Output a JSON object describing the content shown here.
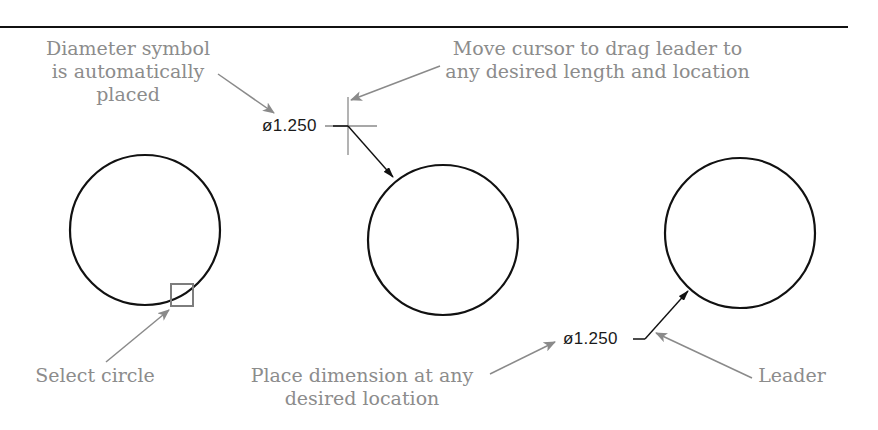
{
  "figure": {
    "type": "cad-dimensioning-illustration",
    "colors": {
      "geometry": "#111111",
      "callout_text": "#8c8c8c",
      "callout_arrow": "#8a8a8a",
      "crosshair": "#7a7a7a",
      "background": "#ffffff"
    }
  },
  "callouts": {
    "diameter_symbol": {
      "lines": [
        "Diameter symbol",
        "is automatically",
        "placed"
      ]
    },
    "move_cursor": {
      "lines": [
        "Move cursor to drag leader to",
        "any desired length and location"
      ]
    },
    "select_circle": {
      "lines": [
        "Select circle"
      ]
    },
    "place_dimension": {
      "lines": [
        "Place dimension at any",
        "desired location"
      ]
    },
    "leader": {
      "lines": [
        "Leader"
      ]
    }
  },
  "dimensions": [
    {
      "id": "dim-dragging",
      "text": "ø1.250",
      "value": 1.25,
      "symbol": "diameter"
    },
    {
      "id": "dim-placed",
      "text": "ø1.250",
      "value": 1.25,
      "symbol": "diameter"
    }
  ],
  "circles": [
    {
      "id": "circle-select",
      "cx": 145,
      "cy": 230,
      "r": 75
    },
    {
      "id": "circle-drag",
      "cx": 443,
      "cy": 240,
      "r": 75
    },
    {
      "id": "circle-placed",
      "cx": 740,
      "cy": 233,
      "r": 75
    }
  ]
}
